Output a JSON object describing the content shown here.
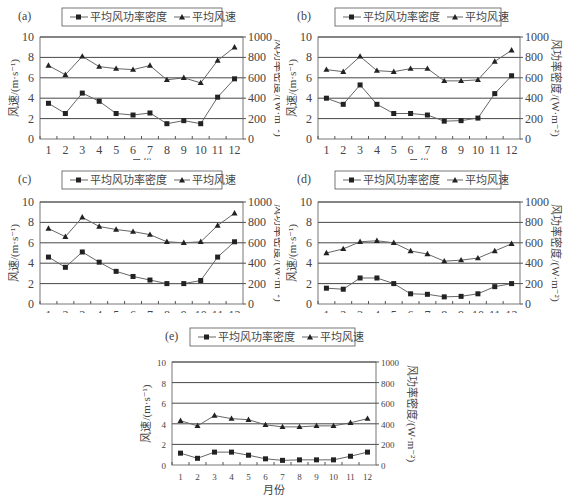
{
  "legend": {
    "density_label": "平均风功率密度",
    "speed_label": "平均风速"
  },
  "axes": {
    "xlabel": "月份",
    "ylabel_left": "风速/(m·s⁻¹)",
    "ylabel_right": "风功率密度/(W·m⁻²)",
    "x_ticks": [
      "1",
      "2",
      "3",
      "4",
      "5",
      "6",
      "7",
      "8",
      "9",
      "10",
      "11",
      "12"
    ],
    "left_ticks": [
      "0",
      "2",
      "4",
      "6",
      "8",
      "10"
    ],
    "right_ticks": [
      "0",
      "200",
      "400",
      "600",
      "800",
      "1000"
    ]
  },
  "colors": {
    "line": "#666666",
    "marker": "#222222",
    "grid": "#333333",
    "frame": "#555555"
  },
  "chart_data": [
    {
      "type": "line",
      "panel": "(a)",
      "categories": [
        "1",
        "2",
        "3",
        "4",
        "5",
        "6",
        "7",
        "8",
        "9",
        "10",
        "11",
        "12"
      ],
      "xlabel": "月份",
      "ylabel": "风速/(m·s⁻¹)",
      "ylabel_right": "风功率密度/(W·m⁻²)",
      "ylim": [
        0,
        10
      ],
      "ylim_right": [
        0,
        1000
      ],
      "grid": true,
      "legend_position": "top",
      "series": [
        {
          "name": "平均风功率密度",
          "axis": "right",
          "marker": "square",
          "values": [
            350,
            250,
            450,
            370,
            250,
            235,
            255,
            150,
            180,
            150,
            410,
            590
          ]
        },
        {
          "name": "平均风速",
          "axis": "left",
          "marker": "triangle",
          "values": [
            7.2,
            6.3,
            8.1,
            7.1,
            6.9,
            6.8,
            7.2,
            5.8,
            6.0,
            5.5,
            7.7,
            9.0
          ]
        }
      ]
    },
    {
      "type": "line",
      "panel": "(b)",
      "categories": [
        "1",
        "2",
        "3",
        "4",
        "5",
        "6",
        "7",
        "8",
        "9",
        "10",
        "11",
        "12"
      ],
      "xlabel": "月份",
      "ylabel": "风速/(m·s⁻¹)",
      "ylabel_right": "风功率密度/(W·m⁻²)",
      "ylim": [
        0,
        10
      ],
      "ylim_right": [
        0,
        1000
      ],
      "grid": true,
      "legend_position": "top",
      "series": [
        {
          "name": "平均风功率密度",
          "axis": "right",
          "marker": "square",
          "values": [
            400,
            340,
            530,
            340,
            250,
            250,
            235,
            175,
            180,
            205,
            445,
            620
          ]
        },
        {
          "name": "平均风速",
          "axis": "left",
          "marker": "triangle",
          "values": [
            6.8,
            6.6,
            8.1,
            6.7,
            6.6,
            6.9,
            6.9,
            5.7,
            5.7,
            5.8,
            7.6,
            8.7
          ]
        }
      ]
    },
    {
      "type": "line",
      "panel": "(c)",
      "categories": [
        "1",
        "2",
        "3",
        "4",
        "5",
        "6",
        "7",
        "8",
        "9",
        "10",
        "11",
        "12"
      ],
      "xlabel": "月份",
      "ylabel": "风速/(m·s⁻¹)",
      "ylabel_right": "风功率密度/(W·m⁻²)",
      "ylim": [
        0,
        10
      ],
      "ylim_right": [
        0,
        1000
      ],
      "grid": true,
      "legend_position": "top",
      "series": [
        {
          "name": "平均风功率密度",
          "axis": "right",
          "marker": "square",
          "values": [
            460,
            360,
            510,
            410,
            320,
            270,
            235,
            200,
            200,
            230,
            460,
            610
          ]
        },
        {
          "name": "平均风速",
          "axis": "left",
          "marker": "triangle",
          "values": [
            7.4,
            6.6,
            8.5,
            7.6,
            7.3,
            7.1,
            6.8,
            6.1,
            6.0,
            6.1,
            7.7,
            8.9
          ]
        }
      ]
    },
    {
      "type": "line",
      "panel": "(d)",
      "categories": [
        "1",
        "2",
        "3",
        "4",
        "5",
        "6",
        "7",
        "8",
        "9",
        "10",
        "11",
        "12"
      ],
      "xlabel": "月份",
      "ylabel": "风速/(m·s⁻¹)",
      "ylabel_right": "风功率密度/(W·m⁻²)",
      "ylim": [
        0,
        10
      ],
      "ylim_right": [
        0,
        1000
      ],
      "grid": true,
      "legend_position": "top",
      "series": [
        {
          "name": "平均风功率密度",
          "axis": "right",
          "marker": "square",
          "values": [
            155,
            145,
            255,
            255,
            200,
            100,
            95,
            70,
            75,
            100,
            170,
            200
          ]
        },
        {
          "name": "平均风速",
          "axis": "left",
          "marker": "triangle",
          "values": [
            5.0,
            5.4,
            6.1,
            6.2,
            6.0,
            5.2,
            4.9,
            4.2,
            4.3,
            4.5,
            5.2,
            5.9
          ]
        }
      ]
    },
    {
      "type": "line",
      "panel": "(e)",
      "categories": [
        "1",
        "2",
        "3",
        "4",
        "5",
        "6",
        "7",
        "8",
        "9",
        "10",
        "11",
        "12"
      ],
      "xlabel": "月份",
      "ylabel": "风速/(m·s⁻¹)",
      "ylabel_right": "风功率密度/(W·m⁻²)",
      "ylim": [
        0,
        10
      ],
      "ylim_right": [
        0,
        1000
      ],
      "grid": true,
      "legend_position": "top",
      "series": [
        {
          "name": "平均风功率密度",
          "axis": "right",
          "marker": "square",
          "values": [
            115,
            65,
            125,
            125,
            95,
            60,
            45,
            50,
            50,
            50,
            85,
            125
          ]
        },
        {
          "name": "平均风速",
          "axis": "left",
          "marker": "triangle",
          "values": [
            4.3,
            3.8,
            4.8,
            4.5,
            4.4,
            3.9,
            3.7,
            3.7,
            3.8,
            3.8,
            4.1,
            4.5
          ]
        }
      ]
    }
  ]
}
